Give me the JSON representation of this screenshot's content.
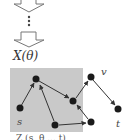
{
  "diagram": {
    "function_label": "X(θ)",
    "caption": "Z (s, θ ... t)",
    "colors": {
      "region_fill": "#c9c9c9",
      "node_fill": "#1a1a1a",
      "edge_stroke": "#333333",
      "arrow_outline": "#666666"
    },
    "nodes": [
      {
        "id": "a",
        "label": "",
        "x": 36,
        "y": 79
      },
      {
        "id": "s",
        "label": "s",
        "x": 20,
        "y": 108
      },
      {
        "id": "b",
        "label": "",
        "x": 73,
        "y": 101
      },
      {
        "id": "c",
        "label": "",
        "x": 55,
        "y": 125
      },
      {
        "id": "d",
        "label": "",
        "x": 91,
        "y": 122
      },
      {
        "id": "v",
        "label": "v",
        "x": 91,
        "y": 77
      },
      {
        "id": "t",
        "label": "t",
        "x": 118,
        "y": 109
      }
    ],
    "edges": [
      {
        "from": "s",
        "to": "a"
      },
      {
        "from": "a",
        "to": "b"
      },
      {
        "from": "c",
        "to": "a"
      },
      {
        "from": "c",
        "to": "d"
      },
      {
        "from": "d",
        "to": "b"
      },
      {
        "from": "b",
        "to": "v"
      },
      {
        "from": "v",
        "to": "t"
      }
    ],
    "node_labels": {
      "s": "s",
      "v": "v",
      "t": "t"
    }
  }
}
